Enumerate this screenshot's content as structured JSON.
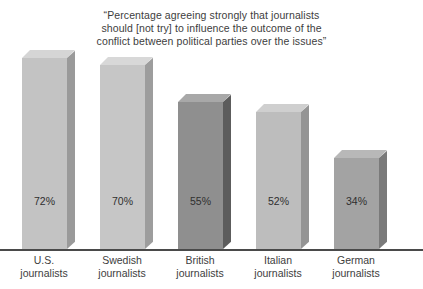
{
  "chart_data": {
    "type": "bar",
    "title": "“Percentage agreeing strongly that journalists\nshould [not try] to influence the outcome of the\nconflict between political parties over the issues”",
    "xlabel": "",
    "ylabel": "",
    "ylim": [
      0,
      100
    ],
    "grid": false,
    "legend": null,
    "categories": [
      "U.S.\njournalists",
      "Swedish\njournalists",
      "British\njournalists",
      "Italian\njournalists",
      "German\njournalists"
    ],
    "values": [
      72,
      70,
      55,
      52,
      34
    ],
    "value_labels": [
      "72%",
      "70%",
      "55%",
      "52%",
      "34%"
    ],
    "bar_colors": [
      "#c3c3c3",
      "#c6c6c6",
      "#8f8f8f",
      "#bdbdbd",
      "#a3a3a3"
    ],
    "bar_side_colors": [
      "#9a9a9a",
      "#9d9d9d",
      "#5c5c5c",
      "#949494",
      "#7a7a7a"
    ],
    "bar_top_colors": [
      "#d5d5d5",
      "#d8d8d8",
      "#a8a8a8",
      "#cfcfcf",
      "#b8b8b8"
    ],
    "axis_color": "#4a4a4a",
    "text_color": "#3d3d3d",
    "background": "#ffffff"
  },
  "layout": {
    "bar_lefts": [
      22,
      100,
      178,
      256,
      334
    ],
    "bar_width": 45,
    "bar_tops": [
      58,
      65,
      102,
      112,
      158
    ],
    "baseline_y": 249,
    "value_label_y": 195,
    "cat_width": 76,
    "cat_lefts": [
      6,
      84,
      162,
      240,
      318
    ]
  }
}
